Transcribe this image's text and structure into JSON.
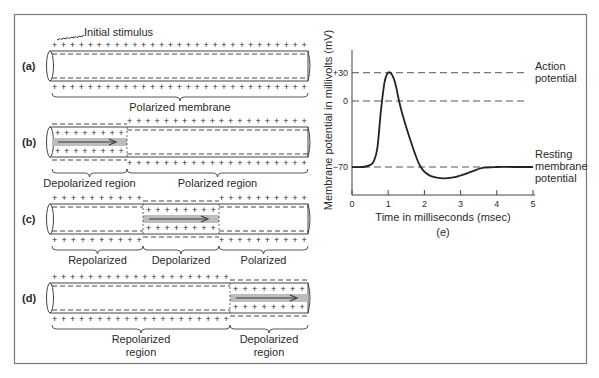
{
  "figure": {
    "frame_color": "#7a7a7a",
    "axon_fill": "#ffffff",
    "depolarized_band_color": "#bdbdbd",
    "arrow_color": "#3a3a3a",
    "initial_stimulus_label": "Initial stimulus",
    "panels": [
      {
        "id": "a",
        "label": "(a)",
        "regions": [
          {
            "name": "Polarized membrane",
            "state": "polarized",
            "lines": [
              "Polarized membrane"
            ]
          }
        ]
      },
      {
        "id": "b",
        "label": "(b)",
        "regions": [
          {
            "name": "Depolarized region",
            "state": "depolarized",
            "lines": [
              "Depolarized region"
            ]
          },
          {
            "name": "Polarized region",
            "state": "polarized",
            "lines": [
              "Polarized region"
            ]
          }
        ]
      },
      {
        "id": "c",
        "label": "(c)",
        "regions": [
          {
            "name": "Repolarized",
            "state": "repolarized",
            "lines": [
              "Repolarized"
            ]
          },
          {
            "name": "Depolarized",
            "state": "depolarized",
            "lines": [
              "Depolarized"
            ]
          },
          {
            "name": "Polarized",
            "state": "polarized",
            "lines": [
              "Polarized"
            ]
          }
        ]
      },
      {
        "id": "d",
        "label": "(d)",
        "regions": [
          {
            "name": "Repolarized region",
            "state": "repolarized",
            "lines": [
              "Repolarized",
              "region"
            ]
          },
          {
            "name": "Depolarized region",
            "state": "depolarized",
            "lines": [
              "Depolarized",
              "region"
            ]
          }
        ]
      }
    ],
    "charge_symbols": {
      "positive": "+",
      "negative": "−"
    }
  },
  "chart_data": {
    "type": "line",
    "title": "",
    "panel_label": "(e)",
    "xlabel": "Time in milliseconds (msec)",
    "ylabel": "Membrane potential in millivolts (mV)",
    "xlim": [
      0,
      5
    ],
    "x_ticks": [
      0,
      1,
      2,
      3,
      4,
      5
    ],
    "y_ticks": [
      {
        "value": 30,
        "label": "+30"
      },
      {
        "value": 0,
        "label": "0"
      },
      {
        "value": -70,
        "label": "−70"
      }
    ],
    "reference_lines": [
      {
        "value": 30,
        "label": [
          "Action",
          "potential"
        ],
        "style": "dashed"
      },
      {
        "value": 0,
        "label": [],
        "style": "dashed"
      },
      {
        "value": -70,
        "label": [
          "Resting",
          "membrane",
          "potential"
        ],
        "style": "dashed"
      }
    ],
    "series": [
      {
        "name": "Membrane potential",
        "x": [
          0,
          0.3,
          0.5,
          0.6,
          0.7,
          0.8,
          0.9,
          1.0,
          1.1,
          1.2,
          1.3,
          1.4,
          1.6,
          1.8,
          1.9,
          2.0,
          2.2,
          2.5,
          2.8,
          3.0,
          3.3,
          3.6,
          4.0,
          4.5,
          5.0
        ],
        "y": [
          -70,
          -70,
          -68,
          -64,
          -50,
          -10,
          20,
          30,
          28,
          18,
          0,
          -15,
          -40,
          -62,
          -70,
          -75,
          -80,
          -82,
          -81,
          -79,
          -75,
          -71,
          -70,
          -70,
          -70
        ]
      }
    ],
    "grid": false,
    "legend": null
  }
}
